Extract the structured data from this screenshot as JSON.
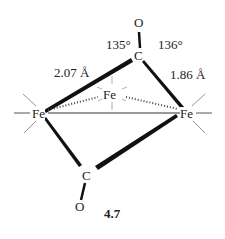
{
  "diagram": {
    "compound_number": "4.7",
    "atoms": {
      "fe_left": "Fe",
      "fe_right": "Fe",
      "fe_back": "Fe",
      "c_top": "C",
      "o_top": "O",
      "c_bottom": "C",
      "o_bottom": "O"
    },
    "annotations": {
      "angle_left": "135°",
      "angle_right": "136°",
      "bond_left": "2.07 Å",
      "bond_right": "1.86 Å"
    }
  }
}
